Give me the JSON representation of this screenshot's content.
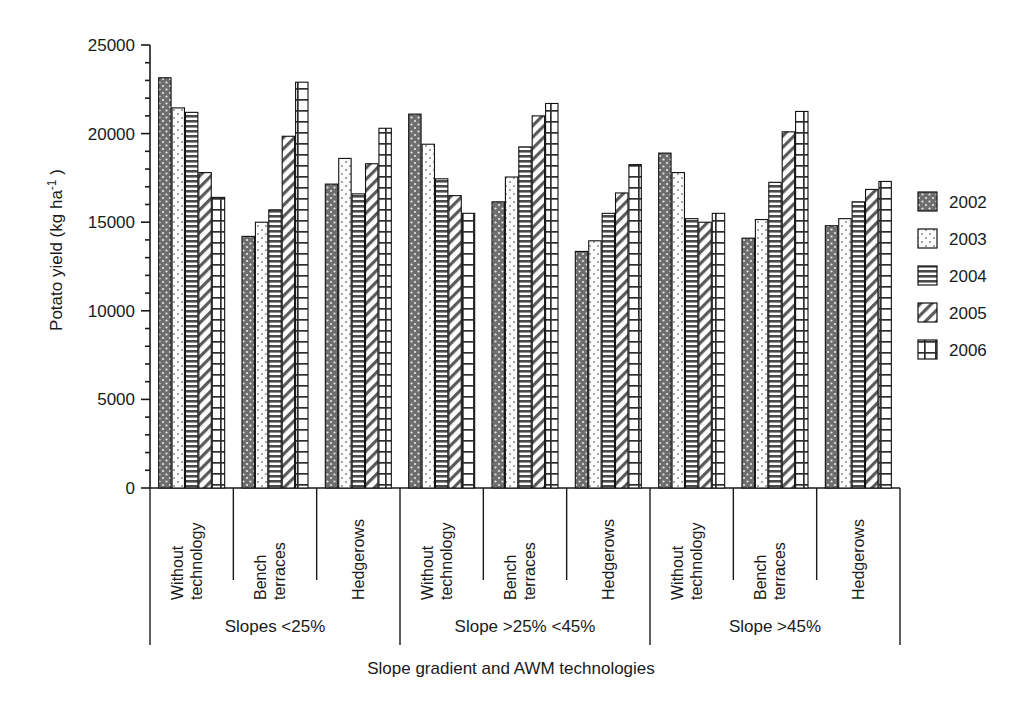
{
  "chart_data": {
    "type": "bar",
    "title": "",
    "subtitle": "",
    "xlabel": "Slope gradient and AWM technologies",
    "ylabel": "Potato yield (kg ha⁻¹)",
    "ylim": [
      0,
      25000
    ],
    "ytick_labels": [
      "25000",
      "20000",
      "15000",
      "10000",
      "5000",
      "0"
    ],
    "ytick_values": [
      25000,
      20000,
      15000,
      10000,
      5000,
      0
    ],
    "grid": false,
    "legend_position": "right",
    "legend": [
      "2002",
      "2003",
      "2004",
      "2005",
      "2006"
    ],
    "categories": [
      "Without technology",
      "Bench terraces",
      "Hedgerows",
      "Without technology",
      "Bench terraces",
      "Hedgerows",
      "Without technology",
      "Bench terraces",
      "Hedgerows"
    ],
    "group_labels": [
      "Slopes <25%",
      "Slope >25% <45%",
      "Slope >45%"
    ],
    "groups_per_panel": 3,
    "series": [
      {
        "name": "2002",
        "pattern": "dark-dotted",
        "values": [
          23150,
          14200,
          17150,
          21100,
          16150,
          13350,
          18900,
          14100,
          14800
        ]
      },
      {
        "name": "2003",
        "pattern": "light-dotted",
        "values": [
          21450,
          15000,
          18600,
          19400,
          17550,
          13950,
          17800,
          15150,
          15200
        ]
      },
      {
        "name": "2004",
        "pattern": "horizontal-lines",
        "values": [
          21200,
          15700,
          16600,
          17450,
          19250,
          15500,
          15200,
          17250,
          16150
        ]
      },
      {
        "name": "2005",
        "pattern": "diagonal-hatch",
        "values": [
          17800,
          19850,
          18300,
          16500,
          21000,
          16650,
          15000,
          20100,
          16850
        ]
      },
      {
        "name": "2006",
        "pattern": "grid",
        "values": [
          16400,
          22900,
          20300,
          15500,
          21700,
          18250,
          15500,
          21250,
          17300
        ]
      }
    ]
  },
  "colors": {
    "axis": "#1a1a1a",
    "background": "#ffffff",
    "series_2002": "#6e6e6e",
    "series_2003": "#fafafa",
    "series_2004": "#8a8a8a",
    "series_2005": "#ffffff",
    "series_2006": "#ffffff"
  }
}
